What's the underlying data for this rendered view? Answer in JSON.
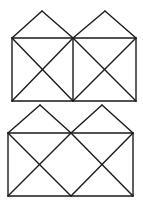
{
  "figures": [
    {
      "id": "figure-top",
      "description": "Two adjacent squares each with both diagonals, each topped by a triangular roof",
      "roof_apexes": [
        [
          42,
          11
        ],
        [
          105,
          11
        ]
      ],
      "rect": {
        "x1": 12,
        "y1": 38,
        "x2": 136,
        "y2": 101
      },
      "middle_x": 73,
      "has_middle_vertical": true,
      "diagonal_style": "x-in-each-square"
    },
    {
      "id": "figure-bottom",
      "description": "Rectangle with two triangular roofs and crossing diagonals forming a central diamond, no middle vertical",
      "roof_apexes": [
        [
          40,
          105
        ],
        [
          102,
          105
        ]
      ],
      "rect": {
        "x1": 8,
        "y1": 133,
        "x2": 133,
        "y2": 196
      },
      "middle_x": 71,
      "has_middle_vertical": false,
      "diagonal_style": "zigzag-diamond"
    }
  ],
  "colors": {
    "line": "#1a1a1a",
    "background": "#ffffff"
  }
}
